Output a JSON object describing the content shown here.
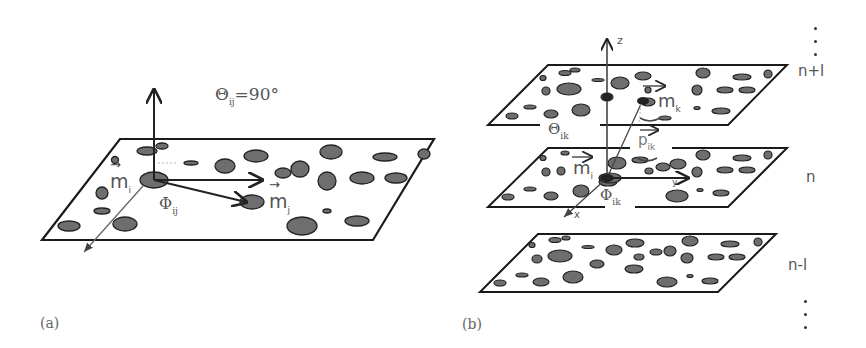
{
  "figure": {
    "panel_a": {
      "label": "(a)",
      "theta_label": "Θ",
      "theta_sub": "ij",
      "theta_value": "=90°",
      "vector_i": "m",
      "vector_i_sub": "i",
      "vector_j": "m",
      "vector_j_sub": "j",
      "phi_label": "Φ",
      "phi_sub": "ij"
    },
    "panel_b": {
      "label": "(b)",
      "axis_z": "z",
      "axis_x": "x",
      "axis_y": "y",
      "theta_label": "Θ",
      "theta_sub": "ik",
      "vector_k": "m",
      "vector_k_sub": "k",
      "vector_i": "m",
      "vector_i_sub": "i",
      "vector_p": "p",
      "vector_p_sub": "ik",
      "phi_label": "Φ",
      "phi_sub": "ik",
      "layers": [
        "n+l",
        "n",
        "n-l"
      ]
    },
    "colors": {
      "line": "#1a1a1a",
      "particle_fill": "#6e6e6e",
      "particle_stroke": "#222222",
      "text": "#555555"
    }
  }
}
